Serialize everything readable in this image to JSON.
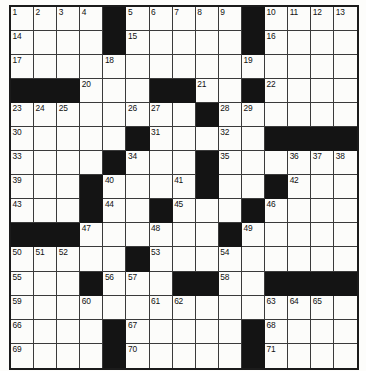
{
  "puzzle": {
    "title": "Crossword Puzzle Grid",
    "rows": 15,
    "columns": 15,
    "block_color": "#141414",
    "open_color": "#fcfcfa",
    "grid_line_color": "#3a3a3a",
    "number_color": "#111111",
    "total_clue_numbers": 71,
    "layout": [
      "OOOOXOOOOOXOOOO",
      "OOOOXOOOOOXOOOO",
      "OOOOOOOOOOOOOOO",
      "XXXOOOXXOOXOOOO",
      "OOOOOOOOXOOOOOO",
      "OOOOOXOOOOOXXXX",
      "OOOOXOOOXOOOOOO",
      "OOOXOOOOXOOXOOO",
      "OOOXOOXOOOXOOOO",
      "XXXOOOOOOXOOOOO",
      "OOOOOXOOOOOOOOO",
      "OOOXOOOXXOOXXXX",
      "OOOOOOOOOOOOOOO",
      "OOOOXOOOOOXOOOO",
      "OOOOXOOOOOXOOOO"
    ],
    "numbers": {
      "0": {
        "0": "1",
        "1": "2",
        "2": "3",
        "3": "4",
        "5": "5",
        "6": "6",
        "7": "7",
        "8": "8",
        "9": "9",
        "11": "10",
        "12": "11",
        "13": "12",
        "14": "13"
      },
      "1": {
        "0": "14",
        "5": "15",
        "11": "16"
      },
      "2": {
        "0": "17",
        "4": "18",
        "10": "19"
      },
      "3": {
        "3": "20",
        "8": "21",
        "11": "22"
      },
      "4": {
        "0": "23",
        "1": "24",
        "2": "25",
        "5": "26",
        "6": "27",
        "9": "28",
        "10": "29"
      },
      "5": {
        "0": "30",
        "6": "31",
        "9": "32"
      },
      "6": {
        "0": "33",
        "5": "34",
        "9": "35",
        "12": "36",
        "13": "37",
        "14": "38"
      },
      "7": {
        "0": "39",
        "4": "40",
        "7": "41",
        "12": "42"
      },
      "8": {
        "0": "43",
        "4": "44",
        "7": "45",
        "11": "46"
      },
      "9": {
        "3": "47",
        "6": "48",
        "10": "49"
      },
      "10": {
        "0": "50",
        "1": "51",
        "2": "52",
        "6": "53",
        "9": "54"
      },
      "11": {
        "0": "55",
        "4": "56",
        "5": "57",
        "9": "58"
      },
      "12": {
        "0": "59",
        "3": "60",
        "6": "61",
        "7": "62",
        "11": "63",
        "12": "64",
        "13": "65"
      },
      "13": {
        "0": "66",
        "5": "67",
        "11": "68"
      },
      "14": {
        "0": "69",
        "5": "70",
        "11": "71"
      }
    },
    "letters": {}
  }
}
